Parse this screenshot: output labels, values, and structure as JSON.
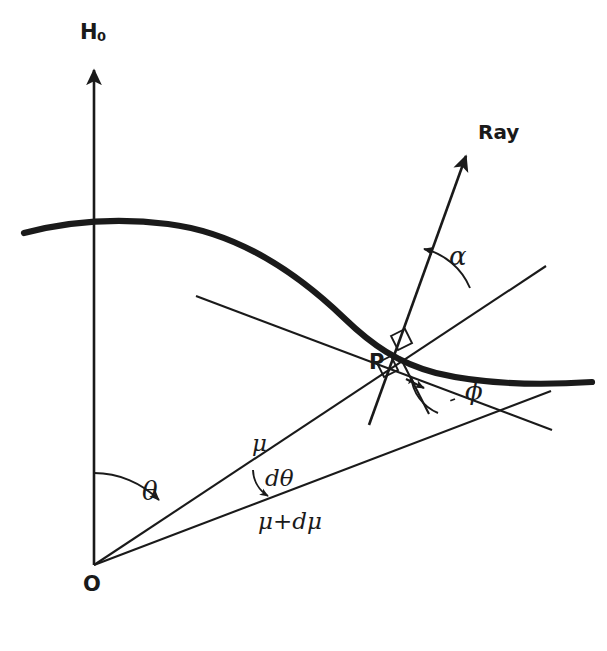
{
  "figure": {
    "background_color": "#ffffff",
    "ink_color": "#1a1a1a",
    "width": 607,
    "height": 651
  },
  "labels": {
    "axis_vertical": "H",
    "axis_vertical_sub": "0",
    "ray": "Ray",
    "origin": "O",
    "point": "P",
    "theta": "θ",
    "d_theta": "dθ",
    "mu": "μ",
    "mu_plus_dmu": "μ+dμ",
    "alpha": "α",
    "phi": "ϕ"
  },
  "elements": {
    "vertical_axis_name": "H0 axis with upward arrow",
    "curve_name": "level surface curve",
    "tangent_name": "tangent line at P",
    "ray_name": "ray direction arrow",
    "mu_ray_name": "radius vector mu",
    "mu_dmu_ray_name": "radius vector mu plus d mu",
    "normal_name": "normal segment at P",
    "right_angle_1": "right angle marker upper",
    "right_angle_2": "right angle marker lower",
    "theta_arc": "theta angle arc",
    "dtheta_arc": "d theta angle arc",
    "alpha_arc": "alpha angle arc",
    "phi_arc": "phi angle arc"
  },
  "geometry": {
    "origin": [
      94,
      565
    ],
    "point_p": [
      400,
      357
    ],
    "axis_top": [
      94,
      63
    ],
    "curve_peak": [
      160,
      222
    ],
    "curve_right_end": [
      592,
      382
    ],
    "ray_tip": [
      470,
      152
    ],
    "alpha_deg": 34,
    "theta_deg": 56
  }
}
